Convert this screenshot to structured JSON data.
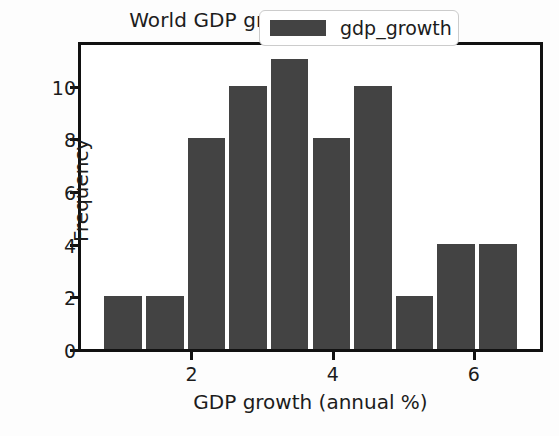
{
  "chart_data": {
    "type": "bar",
    "title": "World GDP growth (annual %)",
    "xlabel": "GDP growth (annual %)",
    "ylabel": "Frequency",
    "categories": [
      "0.75-1.34",
      "1.34-1.93",
      "1.93-2.52",
      "2.52-3.11",
      "3.11-3.70",
      "3.70-4.29",
      "4.29-4.88",
      "4.88-5.47",
      "5.47-6.06",
      "6.06-6.65"
    ],
    "bin_edges": [
      0.75,
      1.34,
      1.93,
      2.52,
      3.11,
      3.7,
      4.29,
      4.88,
      5.47,
      6.06,
      6.65
    ],
    "values": [
      2,
      2,
      8,
      10,
      11,
      8,
      10,
      2,
      4,
      4
    ],
    "series": [
      {
        "name": "gdp_growth",
        "values": [
          2,
          2,
          8,
          10,
          11,
          8,
          10,
          2,
          4,
          4
        ]
      }
    ],
    "xlim": [
      0.45,
      6.95
    ],
    "ylim": [
      0,
      11.55
    ],
    "xticks": [
      2,
      4,
      6
    ],
    "xtick_labels": [
      "2",
      "4",
      "6"
    ],
    "yticks": [
      0,
      2,
      4,
      6,
      8,
      10
    ],
    "ytick_labels": [
      "0",
      "2",
      "4",
      "6",
      "8",
      "10"
    ],
    "grid": false,
    "legend": {
      "position": "upper right",
      "entries": [
        {
          "label": "gdp_growth",
          "color": "#434343"
        }
      ]
    },
    "colors": {
      "bar": "#434343",
      "bar_edge": "#ffffff",
      "axes": "#111111",
      "text": "#1c1c1c",
      "background": "#ffffff"
    }
  }
}
